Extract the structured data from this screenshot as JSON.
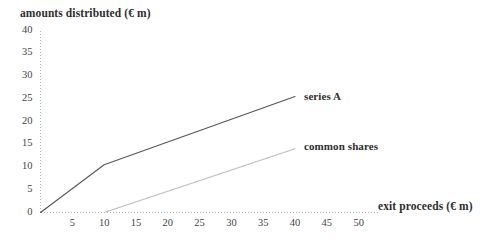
{
  "chart_data": {
    "type": "line",
    "title": "",
    "xlabel": "exit proceeds (€ m)",
    "ylabel": "amounts distributed (€ m)",
    "xlim": [
      0,
      52
    ],
    "ylim": [
      0,
      40
    ],
    "grid": false,
    "legend_position": "inline-end-of-line",
    "xticks": [
      "5",
      "10",
      "15",
      "20",
      "25",
      "30",
      "35",
      "40",
      "45",
      "50"
    ],
    "xtick_values": [
      5,
      10,
      15,
      20,
      25,
      30,
      35,
      40,
      45,
      50
    ],
    "yticks": [
      "0",
      "5",
      "10",
      "15",
      "20",
      "25",
      "30",
      "35",
      "40"
    ],
    "ytick_values": [
      0,
      5,
      10,
      15,
      20,
      25,
      30,
      35,
      40
    ],
    "series": [
      {
        "name": "series A",
        "color": "#575757",
        "points": [
          [
            0,
            0
          ],
          [
            10,
            10.5
          ],
          [
            40,
            25.5
          ]
        ]
      },
      {
        "name": "common shares",
        "color": "#bdbdbd",
        "points": [
          [
            10,
            0
          ],
          [
            40,
            14
          ]
        ]
      }
    ]
  },
  "axes": {
    "x_title": "exit proceeds (€ m)",
    "y_title": "amounts distributed (€ m)",
    "axis_color": "#b4b4b4"
  },
  "labels": {
    "series_a": "series A",
    "common_shares": "common shares"
  }
}
